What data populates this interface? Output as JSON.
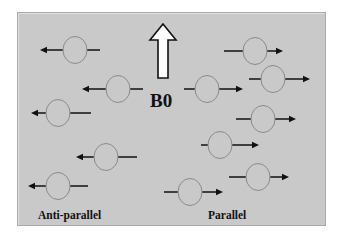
{
  "diagram": {
    "field_label": "B0",
    "labels": {
      "anti_parallel": "Anti-parallel",
      "parallel": "Parallel"
    },
    "colors": {
      "background": "#c9c9c9",
      "circle_stroke": "#8a8a8a",
      "arrow": "#111111"
    },
    "field_arrow": {
      "direction": "up",
      "x": 163,
      "top": 24,
      "bottom": 78
    },
    "spins": {
      "anti_parallel": [
        {
          "cx": 75,
          "cy": 50,
          "head": 40,
          "tail": 100
        },
        {
          "cx": 118,
          "cy": 89,
          "head": 82,
          "tail": 143
        },
        {
          "cx": 58,
          "cy": 113,
          "head": 31,
          "tail": 91
        },
        {
          "cx": 106,
          "cy": 157,
          "head": 76,
          "tail": 137
        },
        {
          "cx": 58,
          "cy": 186,
          "head": 28,
          "tail": 88
        }
      ],
      "parallel": [
        {
          "cx": 255,
          "cy": 51,
          "tail": 224,
          "head": 283
        },
        {
          "cx": 207,
          "cy": 89,
          "tail": 184,
          "head": 243
        },
        {
          "cx": 273,
          "cy": 79,
          "tail": 249,
          "head": 310
        },
        {
          "cx": 263,
          "cy": 119,
          "tail": 236,
          "head": 296
        },
        {
          "cx": 220,
          "cy": 145,
          "tail": 201,
          "head": 259
        },
        {
          "cx": 258,
          "cy": 177,
          "tail": 229,
          "head": 289
        },
        {
          "cx": 190,
          "cy": 192,
          "tail": 164,
          "head": 223
        }
      ]
    }
  }
}
